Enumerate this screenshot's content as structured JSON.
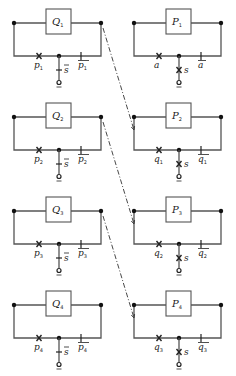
{
  "diagram": {
    "type": "switching-circuit-transformation",
    "colors": {
      "line": "#555555",
      "ink": "#222222",
      "background": "#ffffff"
    },
    "left_column": [
      {
        "block": "Q",
        "sub": "1",
        "cross_label": "p",
        "cross_sub": "1",
        "ctrl_label": "s",
        "ctrl_bar": true,
        "tick_label": "p",
        "tick_sub": "1",
        "tick_bar": true
      },
      {
        "block": "Q",
        "sub": "2",
        "cross_label": "p",
        "cross_sub": "2",
        "ctrl_label": "s",
        "ctrl_bar": true,
        "tick_label": "p",
        "tick_sub": "2",
        "tick_bar": true
      },
      {
        "block": "Q",
        "sub": "3",
        "cross_label": "p",
        "cross_sub": "3",
        "ctrl_label": "s",
        "ctrl_bar": true,
        "tick_label": "p",
        "tick_sub": "3",
        "tick_bar": true
      },
      {
        "block": "Q",
        "sub": "4",
        "cross_label": "p",
        "cross_sub": "4",
        "ctrl_label": "s",
        "ctrl_bar": true,
        "tick_label": "p",
        "tick_sub": "4",
        "tick_bar": true
      }
    ],
    "right_column": [
      {
        "block": "P",
        "sub": "1",
        "cross_label": "a",
        "cross_sub": "",
        "ctrl_label": "s",
        "ctrl_bar": false,
        "tick_label": "a",
        "tick_sub": "",
        "tick_bar": true
      },
      {
        "block": "P",
        "sub": "2",
        "cross_label": "q",
        "cross_sub": "1",
        "ctrl_label": "s",
        "ctrl_bar": false,
        "tick_label": "q",
        "tick_sub": "1",
        "tick_bar": true
      },
      {
        "block": "P",
        "sub": "3",
        "cross_label": "q",
        "cross_sub": "2",
        "ctrl_label": "s",
        "ctrl_bar": false,
        "tick_label": "q",
        "tick_sub": "2",
        "tick_bar": true
      },
      {
        "block": "P",
        "sub": "4",
        "cross_label": "q",
        "cross_sub": "3",
        "ctrl_label": "s",
        "ctrl_bar": false,
        "tick_label": "q",
        "tick_sub": "3",
        "tick_bar": true
      }
    ],
    "arrows": [
      {
        "from": "Q1",
        "to": "P2"
      },
      {
        "from": "Q2",
        "to": "P3"
      },
      {
        "from": "Q3",
        "to": "P4"
      }
    ]
  }
}
